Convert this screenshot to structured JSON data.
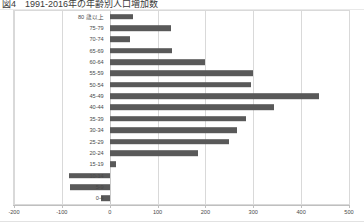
{
  "figure": {
    "title": "図4　1991-2016年の年齢別人口増加数",
    "bar_color": "#595959",
    "grid_color": "#d9d9d9",
    "frame_color": "#d9d9d9"
  },
  "chart_data": {
    "type": "bar",
    "orientation": "horizontal",
    "title": "図4　1991-2016年の年齢別人口増加数",
    "xlabel": "",
    "ylabel": "",
    "xlim": [
      -200,
      500
    ],
    "xticks": [
      -200,
      -100,
      0,
      100,
      200,
      300,
      400,
      500
    ],
    "xtick_labels": [
      "-200",
      "-100",
      "0",
      "100",
      "200",
      "300",
      "400",
      "500"
    ],
    "grid": true,
    "legend": false,
    "categories": [
      "80 歳以上",
      "75-79",
      "70-74",
      "65-69",
      "60-64",
      "55-59",
      "50-54",
      "45-49",
      "40-44",
      "35-39",
      "30-34",
      "25-29",
      "20-24",
      "15-19",
      "10-14",
      "5-9",
      "0-4"
    ],
    "values": [
      48,
      128,
      43,
      130,
      200,
      300,
      296,
      437,
      343,
      284,
      265,
      250,
      185,
      13,
      -85,
      -84,
      -18
    ]
  }
}
